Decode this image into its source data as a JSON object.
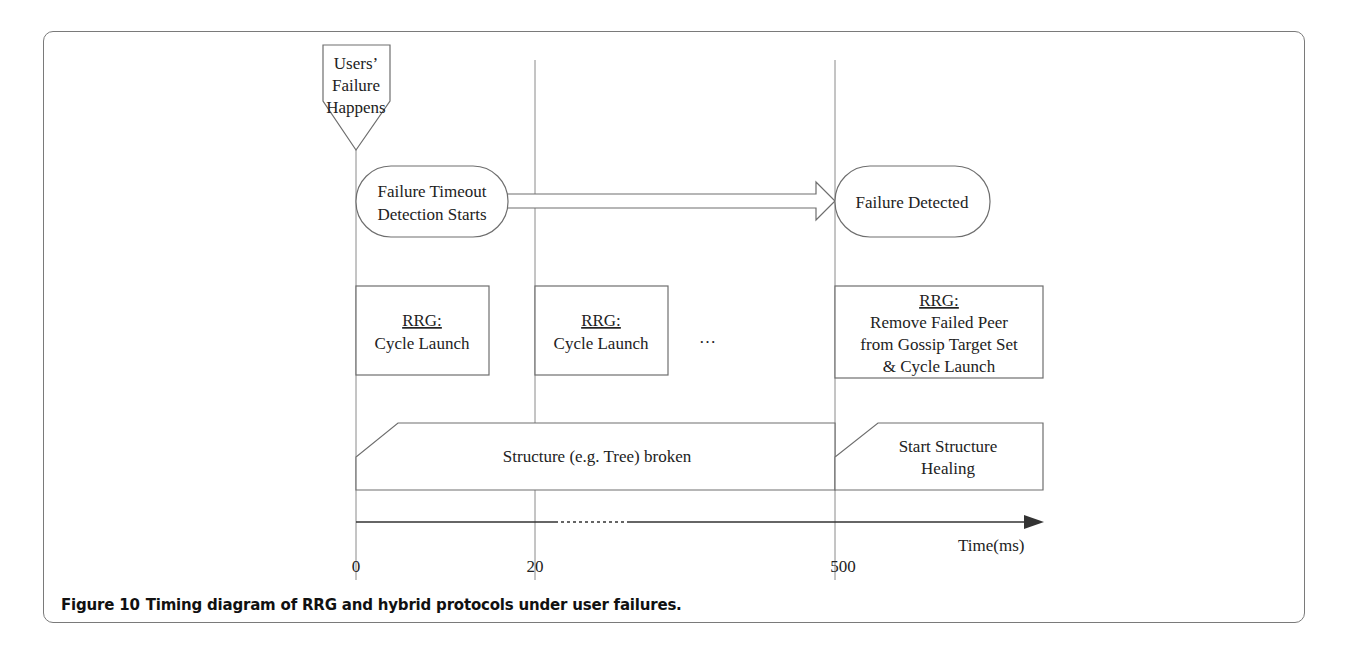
{
  "figure": {
    "number": "Figure 10",
    "caption": "Timing diagram of RRG and hybrid protocols under user failures."
  },
  "markers": {
    "failure_event": [
      "Users’",
      "Failure",
      "Happens"
    ]
  },
  "detection": {
    "start": [
      "Failure Timeout",
      "Detection Starts"
    ],
    "end": [
      "Failure Detected"
    ]
  },
  "rrg_boxes": [
    {
      "heading": "RRG:",
      "lines": [
        "Cycle Launch"
      ]
    },
    {
      "heading": "RRG:",
      "lines": [
        "Cycle Launch"
      ]
    },
    {
      "heading": "RRG:",
      "lines": [
        "Remove Failed Peer",
        "from Gossip Target Set",
        "& Cycle Launch"
      ]
    }
  ],
  "ellipsis": "…",
  "structure": {
    "broken": "Structure (e.g. Tree) broken",
    "healing": [
      "Start Structure",
      "Healing"
    ]
  },
  "axis": {
    "label": "Time(ms)",
    "ticks": [
      "0",
      "20",
      "500"
    ]
  },
  "colors": {
    "stroke": "#6e6e6e",
    "text": "#222222",
    "axis": "#333333",
    "frame": "#7a7a7a"
  }
}
